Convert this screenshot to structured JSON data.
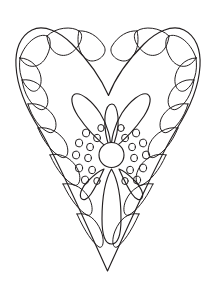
{
  "page": {
    "background_color": "#ffffff",
    "line_color": "#231f20",
    "width": 219,
    "height": 289,
    "style": "line-art / coloring-page outline drawing"
  },
  "artwork": {
    "name": "decorated-heart",
    "description": "Outline drawing of a heart with a scalloped petal border and a central flower motif",
    "elements": [
      {
        "name": "heart-outline",
        "label": "Heart outline",
        "stroke": "#231f20",
        "fill": "none"
      },
      {
        "name": "scallop-border",
        "label": "Scalloped petal border",
        "count_left": 9,
        "count_right": 9,
        "stroke": "#231f20"
      },
      {
        "name": "flower-motif",
        "label": "Central flower",
        "parts": {
          "center_circle": {
            "cx": 112,
            "cy": 153,
            "r": 13
          },
          "upper_petals": 3,
          "lower_teardrops": 2,
          "lower_long_petal": 1,
          "dots_left": 11,
          "dots_right": 11
        }
      }
    ]
  },
  "colors": {
    "line": "#231f20",
    "background": "#ffffff"
  }
}
